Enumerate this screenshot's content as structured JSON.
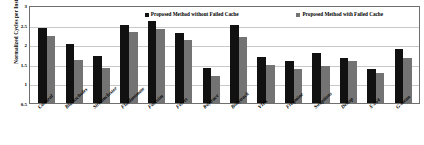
{
  "chart_data": {
    "type": "bar",
    "title": "",
    "xlabel": "",
    "ylabel": "Normalized Cycles per Instruction",
    "ylim": [
      0.5,
      3
    ],
    "yticks": [
      "3",
      "2.5",
      "2",
      "1.5",
      "1",
      "0.5"
    ],
    "grid": true,
    "legend_position": "top-inside",
    "categories": [
      "Canneal",
      "Blackscholes",
      "Streamcluster",
      "Fluidanimate",
      "Facesim",
      "Ferret",
      "Raytrace",
      "Bodytrack",
      "VIPs",
      "Freqmine",
      "Swaptions",
      "Dedup",
      "X-264",
      "G-mean"
    ],
    "series": [
      {
        "name": "Proposed Method without Failed Cache",
        "color": "#111111",
        "values": [
          2.41,
          2.01,
          1.71,
          2.5,
          2.59,
          2.29,
          1.39,
          2.48,
          1.68,
          1.57,
          1.77,
          1.66,
          1.37,
          1.88
        ]
      },
      {
        "name": "Proposed Method with Failed Cache",
        "color": "#737373",
        "values": [
          2.21,
          1.6,
          1.4,
          2.3,
          2.39,
          2.1,
          1.19,
          2.18,
          1.47,
          1.37,
          1.45,
          1.56,
          1.27,
          1.64
        ]
      }
    ]
  }
}
